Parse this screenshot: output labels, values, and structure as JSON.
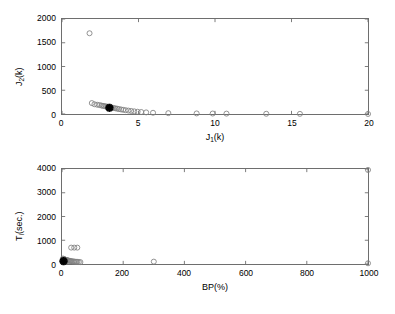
{
  "figure": {
    "background": "#ffffff",
    "axis_color": "#6e6e6e",
    "marker_edge_color": "#808080",
    "marker_star_color": "#000000"
  },
  "chart_data": [
    {
      "type": "scatter",
      "id": "objective-space",
      "title": "",
      "xlabel": "J_1(k)",
      "xlabel_base": "J",
      "xlabel_sub": "1",
      "xlabel_tail": "(k)",
      "ylabel": "J_2(k)",
      "ylabel_base": "J",
      "ylabel_sub": "2",
      "ylabel_tail": "(k)",
      "xlim": [
        0,
        20
      ],
      "ylim": [
        0,
        2000
      ],
      "xticks": [
        0,
        5,
        10,
        15,
        20
      ],
      "xtick_labels": [
        "0",
        "5",
        "10",
        "15",
        "20"
      ],
      "yticks": [
        0,
        500,
        1000,
        1500,
        2000
      ],
      "ytick_labels": [
        "0",
        "500",
        "1000",
        "1500",
        "2000"
      ],
      "grid": false,
      "legend": "none",
      "series": [
        {
          "name": "pareto-points",
          "marker": "circle-open",
          "color": "#808080",
          "points": [
            [
              1.8,
              1700
            ],
            [
              1.95,
              230
            ],
            [
              2.12,
              205
            ],
            [
              2.3,
              195
            ],
            [
              2.45,
              188
            ],
            [
              2.58,
              178
            ],
            [
              2.68,
              172
            ],
            [
              2.78,
              166
            ],
            [
              2.88,
              160
            ],
            [
              2.96,
              152
            ],
            [
              3.05,
              146
            ],
            [
              3.16,
              140
            ],
            [
              3.26,
              134
            ],
            [
              3.36,
              128
            ],
            [
              3.48,
              120
            ],
            [
              3.6,
              112
            ],
            [
              3.72,
              104
            ],
            [
              3.86,
              96
            ],
            [
              4.0,
              88
            ],
            [
              4.16,
              80
            ],
            [
              4.34,
              72
            ],
            [
              4.52,
              64
            ],
            [
              4.72,
              56
            ],
            [
              4.94,
              48
            ],
            [
              5.18,
              42
            ],
            [
              5.5,
              34
            ],
            [
              5.95,
              26
            ],
            [
              6.95,
              18
            ],
            [
              8.8,
              12
            ],
            [
              9.85,
              10
            ],
            [
              10.75,
              8
            ],
            [
              13.35,
              5
            ],
            [
              15.55,
              3
            ],
            [
              20.0,
              1
            ]
          ]
        },
        {
          "name": "selected-solution",
          "marker": "star-filled",
          "color": "#000000",
          "points": [
            [
              3.1,
              130
            ]
          ]
        }
      ]
    },
    {
      "type": "scatter",
      "id": "bandwidth-time-space",
      "title": "",
      "xlabel": "BP(%)",
      "ylabel": "T_i(sec.)",
      "ylabel_base": "T",
      "ylabel_sub": "i",
      "ylabel_tail": "(sec.)",
      "xlim": [
        0,
        1000
      ],
      "ylim": [
        0,
        4000
      ],
      "xticks": [
        0,
        200,
        400,
        600,
        800,
        1000
      ],
      "xtick_labels": [
        "0",
        "200",
        "400",
        "600",
        "800",
        "1000"
      ],
      "yticks": [
        0,
        1000,
        2000,
        3000,
        4000
      ],
      "ytick_labels": [
        "0",
        "1000",
        "2000",
        "3000",
        "4000"
      ],
      "grid": false,
      "legend": "none",
      "series": [
        {
          "name": "pareto-points",
          "marker": "circle-open",
          "color": "#808080",
          "points": [
            [
              1000,
              3960
            ],
            [
              1000,
              30
            ],
            [
              300,
              100
            ],
            [
              30,
              690
            ],
            [
              40,
              690
            ],
            [
              50,
              690
            ],
            [
              3,
              230
            ],
            [
              5,
              215
            ],
            [
              7,
              200
            ],
            [
              9,
              190
            ],
            [
              11,
              180
            ],
            [
              13,
              172
            ],
            [
              15,
              165
            ],
            [
              17,
              158
            ],
            [
              19,
              150
            ],
            [
              21,
              142
            ],
            [
              24,
              135
            ],
            [
              27,
              128
            ],
            [
              30,
              120
            ],
            [
              34,
              112
            ],
            [
              38,
              106
            ],
            [
              42,
              100
            ],
            [
              46,
              95
            ],
            [
              50,
              90
            ],
            [
              55,
              85
            ],
            [
              60,
              80
            ],
            [
              4,
              150
            ],
            [
              6,
              140
            ],
            [
              8,
              130
            ],
            [
              10,
              125
            ],
            [
              12,
              118
            ],
            [
              14,
              110
            ],
            [
              2,
              110
            ],
            [
              3,
              95
            ],
            [
              4,
              80
            ]
          ]
        },
        {
          "name": "selected-solution",
          "marker": "star-filled",
          "color": "#000000",
          "points": [
            [
              5,
              120
            ]
          ]
        }
      ]
    }
  ]
}
